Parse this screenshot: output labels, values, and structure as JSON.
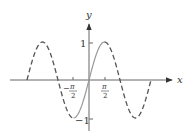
{
  "figure": {
    "axes": {
      "x_label": "x",
      "y_label": "y",
      "x_ticks": [
        {
          "value": "-π/2",
          "numerator": "π",
          "sign": "−",
          "denominator": "2"
        },
        {
          "value": "π/2",
          "numerator": "π",
          "sign": "",
          "denominator": "2"
        }
      ],
      "y_ticks": [
        {
          "value": 1,
          "label": "1"
        },
        {
          "value": -1,
          "label": "−1"
        }
      ]
    },
    "curve": {
      "function": "sin x",
      "domain": [
        "-2π",
        "2π"
      ],
      "solid_interval": [
        "-π/2",
        "π/2"
      ],
      "dashed_intervals": [
        [
          "-2π",
          "-π/2"
        ],
        [
          "π/2",
          "2π"
        ]
      ],
      "solid_color": "#999999",
      "dashed_color": "#555555"
    },
    "axis_color": "#555555"
  }
}
